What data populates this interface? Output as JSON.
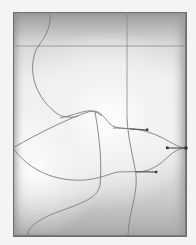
{
  "artboard": {
    "object": "gradient-mesh",
    "frame": {
      "x": 13,
      "y": 12,
      "width": 173,
      "height": 224
    },
    "colors": {
      "frame_stroke": "#6e6e6e",
      "mesh_line": "#7d7d7d",
      "handle": "#3a3a3a",
      "highlight": "#ffffff",
      "shadow": "#9a9a9a"
    }
  }
}
